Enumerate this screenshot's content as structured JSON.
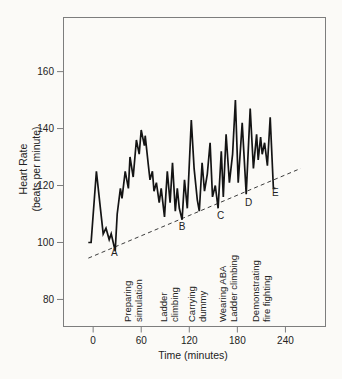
{
  "figure": {
    "background": "#fbfaf7",
    "ink": "#1a1a1a",
    "frame_color": "#7d7d7d",
    "trace_color": "#141414",
    "trend_color": "#3c3c3c"
  },
  "chart_data": {
    "type": "line",
    "title": "",
    "xlabel": "Time (minutes)",
    "ylabel_lines": [
      "Heart Rate",
      "(beats per minute)"
    ],
    "x_ticks": [
      0,
      60,
      120,
      180,
      240
    ],
    "y_ticks": [
      80,
      100,
      120,
      140,
      160
    ],
    "xlim": [
      -37,
      290
    ],
    "ylim": [
      70.5,
      179
    ],
    "grid": false,
    "legend": "none",
    "series": [
      {
        "name": "heart-rate",
        "points": [
          [
            -6,
            100
          ],
          [
            -2.5,
            100
          ],
          [
            4,
            125
          ],
          [
            9,
            112
          ],
          [
            12.5,
            103
          ],
          [
            16,
            105
          ],
          [
            20,
            101
          ],
          [
            22.5,
            103
          ],
          [
            27.5,
            97
          ],
          [
            30,
            110
          ],
          [
            34,
            119
          ],
          [
            36,
            115.5
          ],
          [
            40,
            125
          ],
          [
            44,
            119
          ],
          [
            46,
            130
          ],
          [
            50,
            123
          ],
          [
            54,
            136
          ],
          [
            57.5,
            131
          ],
          [
            60,
            139.5
          ],
          [
            64,
            134
          ],
          [
            65,
            137.5
          ],
          [
            69,
            127
          ],
          [
            71,
            122
          ],
          [
            74,
            125
          ],
          [
            76,
            118
          ],
          [
            79,
            121
          ],
          [
            82.5,
            114
          ],
          [
            85,
            119
          ],
          [
            89,
            109
          ],
          [
            92.5,
            125
          ],
          [
            96,
            114
          ],
          [
            99,
            128
          ],
          [
            102.5,
            111
          ],
          [
            105,
            119
          ],
          [
            107.5,
            112
          ],
          [
            111,
            108
          ],
          [
            114,
            122
          ],
          [
            117.5,
            112
          ],
          [
            122.5,
            143
          ],
          [
            126,
            126
          ],
          [
            130,
            115
          ],
          [
            132.5,
            111
          ],
          [
            136,
            128
          ],
          [
            139,
            118
          ],
          [
            142.5,
            124
          ],
          [
            146,
            135
          ],
          [
            149,
            116
          ],
          [
            152.5,
            120
          ],
          [
            156,
            112
          ],
          [
            160,
            132
          ],
          [
            162.5,
            116
          ],
          [
            166,
            138
          ],
          [
            170,
            121
          ],
          [
            174,
            131
          ],
          [
            177.5,
            150
          ],
          [
            181,
            121
          ],
          [
            186,
            142
          ],
          [
            191,
            117
          ],
          [
            196,
            147
          ],
          [
            200,
            126
          ],
          [
            204,
            138
          ],
          [
            206,
            129
          ],
          [
            209,
            137
          ],
          [
            211,
            131
          ],
          [
            214,
            135
          ],
          [
            217.5,
            127
          ],
          [
            221,
            144
          ],
          [
            225,
            119
          ],
          [
            227.5,
            119
          ]
        ]
      }
    ],
    "trend_line": {
      "style": "dashed",
      "from": {
        "t": -6,
        "bpm": 94.5
      },
      "to": {
        "t": 259,
        "bpm": 126
      }
    },
    "point_labels": [
      {
        "text": "A",
        "t": 26.5,
        "bpm": 96.5
      },
      {
        "text": "B",
        "t": 111,
        "bpm": 105.5
      },
      {
        "text": "C",
        "t": 159,
        "bpm": 109.5
      },
      {
        "text": "D",
        "t": 194,
        "bpm": 114
      },
      {
        "text": "E",
        "t": 227.5,
        "bpm": 117.5
      }
    ],
    "activity_labels": [
      {
        "lines": [
          "Preparing",
          "simulation"
        ],
        "t": 54
      },
      {
        "lines": [
          "Ladder",
          "climbing"
        ],
        "t": 99
      },
      {
        "lines": [
          "Carrying",
          "dummy"
        ],
        "t": 134
      },
      {
        "lines": [
          "Wearing ABA",
          "Ladder climbing"
        ],
        "t": 173
      },
      {
        "lines": [
          "Demonstrating",
          "fire fighting"
        ],
        "t": 214
      }
    ]
  }
}
